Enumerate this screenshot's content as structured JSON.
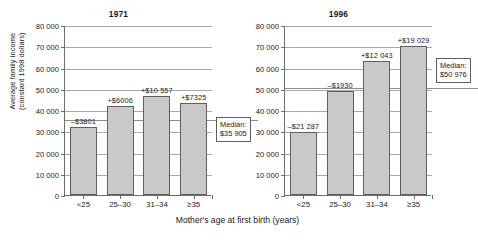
{
  "axes": {
    "ylabel_line1": "Average family income",
    "ylabel_line2": "(constant 1998 dollars)",
    "xlabel": "Mother's age at first birth (years)",
    "yticks": [
      "80 000",
      "70 000",
      "60 000",
      "50 000",
      "40 000",
      "30 000",
      "20 000",
      "10 000",
      "0"
    ],
    "categories": [
      "<25",
      "25–30",
      "31–34",
      "≥35"
    ]
  },
  "panels": [
    {
      "title": "1971",
      "median_label_line1": "Median:",
      "median_label_line2": "$35 905",
      "bar_labels": [
        "–$3801",
        "+$6006",
        "+$10 557",
        "+$7325"
      ]
    },
    {
      "title": "1996",
      "median_label_line1": "Median:",
      "median_label_line2": "$50 976",
      "bar_labels": [
        "–$21 287",
        "–$1930",
        "+$12 043",
        "+$19 029"
      ]
    }
  ],
  "chart_data": {
    "type": "bar",
    "xlabel": "Mother's age at first birth (years)",
    "ylabel": "Average family income (constant 1998 dollars)",
    "ylim": [
      0,
      80000
    ],
    "ytick_values": [
      0,
      10000,
      20000,
      30000,
      40000,
      50000,
      60000,
      70000,
      80000
    ],
    "grid": true,
    "legend": "none",
    "categories": [
      "<25",
      "25–30",
      "31–34",
      "≥35"
    ],
    "panels": [
      {
        "name": "1971",
        "median": 35905,
        "median_annotation": "Median: $35 905",
        "values": [
          32104,
          41911,
          46462,
          43230
        ],
        "differences_from_median": [
          -3801,
          6006,
          10557,
          7325
        ],
        "data_labels": [
          "–$3801",
          "+$6006",
          "+$10 557",
          "+$7325"
        ]
      },
      {
        "name": "1996",
        "median": 50976,
        "median_annotation": "Median: $50 976",
        "values": [
          29689,
          49046,
          63019,
          70005
        ],
        "differences_from_median": [
          -21287,
          -1930,
          12043,
          19029
        ],
        "data_labels": [
          "–$21 287",
          "–$1930",
          "+$12 043",
          "+$19 029"
        ]
      }
    ]
  },
  "style": {
    "bar_fill": "#c9c9c9",
    "bar_stroke": "#5f5f5f",
    "axis_color": "#6d6d6d",
    "grid_color": "#a9a9a9",
    "median_line_color": "#8e8e8e",
    "text_color": "#1a1a1a"
  }
}
